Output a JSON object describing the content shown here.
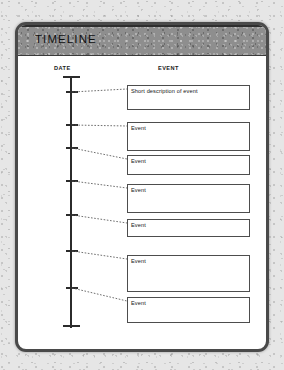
{
  "document": {
    "title": "TIMELINE",
    "columns": {
      "date_header": "DATE",
      "event_header": "EVENT"
    },
    "colors": {
      "page_background": "#e6e6e6",
      "paper": "#ffffff",
      "frame_border": "#4a4a4a",
      "title_band": "#8e8e8e",
      "axis": "#2b2b2b",
      "box_border": "#4d4d4d",
      "connector": "#555555",
      "text": "#151515"
    }
  },
  "timeline": {
    "axis": {
      "top_cap": true,
      "bottom_cap": true,
      "tick_count": 7,
      "tick_positions": [
        66,
        99,
        122,
        155,
        189,
        225,
        262
      ]
    },
    "events": [
      {
        "label": "Short description of event",
        "tick_y": 66,
        "box_top": 60,
        "box_height": 25
      },
      {
        "label": "Event",
        "tick_y": 99,
        "box_top": 97,
        "box_height": 29
      },
      {
        "label": "Event",
        "tick_y": 122,
        "box_top": 130,
        "box_height": 20
      },
      {
        "label": "Event",
        "tick_y": 155,
        "box_top": 159,
        "box_height": 29
      },
      {
        "label": "Event",
        "tick_y": 189,
        "box_top": 194,
        "box_height": 18
      },
      {
        "label": "Event",
        "tick_y": 225,
        "box_top": 230,
        "box_height": 37
      },
      {
        "label": "Event",
        "tick_y": 262,
        "box_top": 272,
        "box_height": 26
      }
    ]
  }
}
